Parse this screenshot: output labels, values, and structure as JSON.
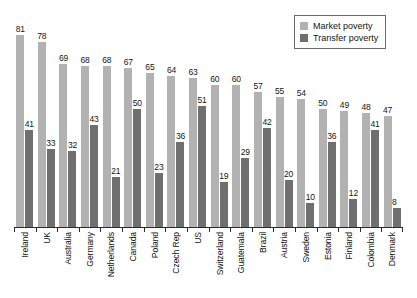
{
  "legend": {
    "position": "top-right",
    "items": [
      {
        "label": "Market poverty",
        "key": "market",
        "color": "#b2b2b2"
      },
      {
        "label": "Transfer poverty",
        "key": "transfer",
        "color": "#6f6f6f"
      }
    ]
  },
  "axis": {
    "ylim_max": 90,
    "grid": false,
    "y_ticks_visible": false,
    "x_baseline_visible": true
  },
  "chart_data": {
    "type": "bar",
    "title": "",
    "xlabel": "",
    "ylabel": "",
    "ylim": [
      0,
      90
    ],
    "grid": false,
    "legend_position": "top-right",
    "categories": [
      "Ireland",
      "UK",
      "Australia",
      "Germany",
      "Netherlands",
      "Canada",
      "Poland",
      "Czech Rep",
      "US",
      "Switzerland",
      "Guatemala",
      "Brazil",
      "Austria",
      "Sweden",
      "Estonia",
      "Finland",
      "Colombia",
      "Denmark"
    ],
    "series": [
      {
        "name": "Market poverty",
        "color": "#b2b2b2",
        "values": [
          81,
          78,
          69,
          68,
          68,
          67,
          65,
          64,
          63,
          60,
          60,
          57,
          55,
          54,
          50,
          49,
          48,
          47
        ]
      },
      {
        "name": "Transfer poverty",
        "color": "#6f6f6f",
        "values": [
          41,
          33,
          32,
          43,
          21,
          50,
          23,
          36,
          51,
          19,
          29,
          42,
          20,
          10,
          36,
          12,
          41,
          8
        ]
      }
    ]
  }
}
